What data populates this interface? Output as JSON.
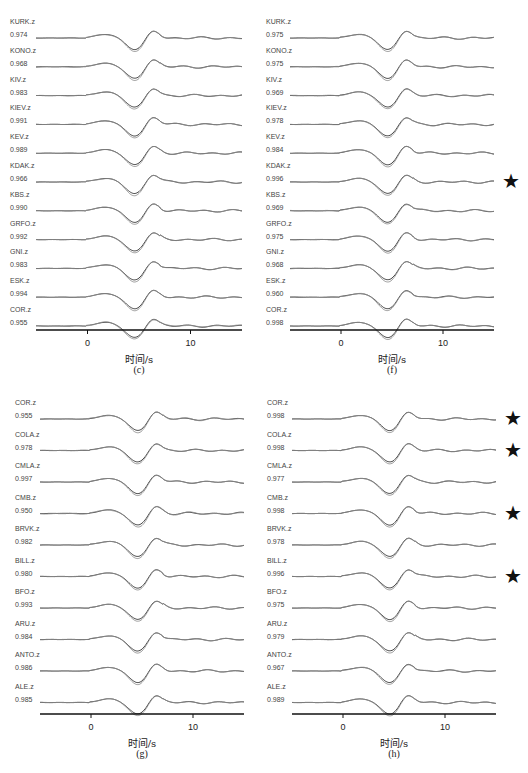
{
  "chart_data": [
    {
      "id": "c",
      "type": "line",
      "caption": "(c)",
      "xlabel": "时间/s",
      "xlim": [
        -5,
        15
      ],
      "xticks": [
        0,
        10
      ],
      "tick_labels": [
        "0",
        "10"
      ],
      "traces": [
        {
          "station": "KURK.z",
          "cc": "0.974",
          "star": false
        },
        {
          "station": "KONO.z",
          "cc": "0.968",
          "star": false
        },
        {
          "station": "KIV.z",
          "cc": "0.983",
          "star": false
        },
        {
          "station": "KIEV.z",
          "cc": "0.991",
          "star": false
        },
        {
          "station": "KEV.z",
          "cc": "0.989",
          "star": false
        },
        {
          "station": "KDAK.z",
          "cc": "0.966",
          "star": false
        },
        {
          "station": "KBS.z",
          "cc": "0.990",
          "star": false
        },
        {
          "station": "GRFO.z",
          "cc": "0.992",
          "star": false
        },
        {
          "station": "GNI.z",
          "cc": "0.983",
          "star": false
        },
        {
          "station": "ESK.z",
          "cc": "0.994",
          "star": false
        },
        {
          "station": "COR.z",
          "cc": "0.955",
          "star": false
        }
      ]
    },
    {
      "id": "f",
      "type": "line",
      "caption": "(f)",
      "xlabel": "时间/s",
      "xlim": [
        -5,
        15
      ],
      "xticks": [
        0,
        10
      ],
      "tick_labels": [
        "0",
        "10"
      ],
      "traces": [
        {
          "station": "KURK.z",
          "cc": "0.975",
          "star": false
        },
        {
          "station": "KONO.z",
          "cc": "0.975",
          "star": false
        },
        {
          "station": "KIV.z",
          "cc": "0.969",
          "star": false
        },
        {
          "station": "KIEV.z",
          "cc": "0.978",
          "star": false
        },
        {
          "station": "KEV.z",
          "cc": "0.984",
          "star": false
        },
        {
          "station": "KDAK.z",
          "cc": "0.996",
          "star": true
        },
        {
          "station": "KBS.z",
          "cc": "0.969",
          "star": false
        },
        {
          "station": "GRFO.z",
          "cc": "0.975",
          "star": false
        },
        {
          "station": "GNI.z",
          "cc": "0.968",
          "star": false
        },
        {
          "station": "ESK.z",
          "cc": "0.960",
          "star": false
        },
        {
          "station": "COR.z",
          "cc": "0.998",
          "star": false
        }
      ]
    },
    {
      "id": "g",
      "type": "line",
      "caption": "(g)",
      "xlabel": "时间/s",
      "xlim": [
        -5,
        15
      ],
      "xticks": [
        0,
        10
      ],
      "tick_labels": [
        "0",
        "10"
      ],
      "traces": [
        {
          "station": "COR.z",
          "cc": "0.955",
          "star": false
        },
        {
          "station": "COLA.z",
          "cc": "0.978",
          "star": false
        },
        {
          "station": "CMLA.z",
          "cc": "0.997",
          "star": false
        },
        {
          "station": "CMB.z",
          "cc": "0.950",
          "star": false
        },
        {
          "station": "BRVK.z",
          "cc": "0.982",
          "star": false
        },
        {
          "station": "BILL.z",
          "cc": "0.980",
          "star": false
        },
        {
          "station": "BFO.z",
          "cc": "0.993",
          "star": false
        },
        {
          "station": "ARU.z",
          "cc": "0.984",
          "star": false
        },
        {
          "station": "ANTO.z",
          "cc": "0.986",
          "star": false
        },
        {
          "station": "ALE.z",
          "cc": "0.985",
          "star": false
        }
      ]
    },
    {
      "id": "h",
      "type": "line",
      "caption": "(h)",
      "xlabel": "时间/s",
      "xlim": [
        -5,
        15
      ],
      "xticks": [
        0,
        10
      ],
      "tick_labels": [
        "0",
        "10"
      ],
      "traces": [
        {
          "station": "COR.z",
          "cc": "0.998",
          "star": true
        },
        {
          "station": "COLA.z",
          "cc": "0.998",
          "star": true
        },
        {
          "station": "CMLA.z",
          "cc": "0.977",
          "star": false
        },
        {
          "station": "CMB.z",
          "cc": "0.998",
          "star": true
        },
        {
          "station": "BRVK.z",
          "cc": "0.978",
          "star": false
        },
        {
          "station": "BILL.z",
          "cc": "0.996",
          "star": true
        },
        {
          "station": "BFO.z",
          "cc": "0.975",
          "star": false
        },
        {
          "station": "ARU.z",
          "cc": "0.979",
          "star": false
        },
        {
          "station": "ANTO.z",
          "cc": "0.967",
          "star": false
        },
        {
          "station": "ALE.z",
          "cc": "0.989",
          "star": false
        }
      ]
    }
  ],
  "colors": {
    "observed": "#333333",
    "synthetic": "#8a8a8a",
    "axis": "#111111",
    "star": "#111111"
  },
  "legend_symbol": "★"
}
